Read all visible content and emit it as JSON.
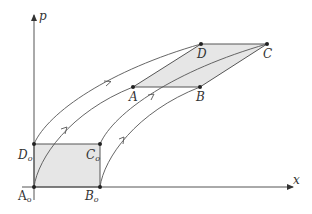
{
  "figure": {
    "axes": {
      "x_label": "x",
      "y_label": "p",
      "origin": [
        34,
        187
      ],
      "x_end": [
        293,
        187
      ],
      "y_end": [
        34,
        14
      ]
    },
    "colors": {
      "stroke": "#555555",
      "fill": "#e6e6e6",
      "point": "#222222",
      "text": "#333333"
    },
    "initial_region": {
      "vertices": {
        "A0": [
          34,
          187
        ],
        "B0": [
          100,
          187
        ],
        "C0": [
          100,
          144
        ],
        "D0": [
          34,
          144
        ]
      },
      "labels": {
        "A0": "A",
        "B0": "B",
        "C0": "C",
        "D0": "D",
        "subscript": "o"
      }
    },
    "evolved_region": {
      "vertices": {
        "A": [
          133,
          87
        ],
        "B": [
          200,
          87
        ],
        "C": [
          267,
          44
        ],
        "D": [
          201,
          44
        ]
      },
      "labels": {
        "A": "A",
        "B": "B",
        "C": "C",
        "D": "D"
      }
    },
    "trajectories": [
      {
        "from": "D0",
        "to": "D",
        "arrow_at": [
          110,
          82
        ]
      },
      {
        "from": "A0",
        "to": "A",
        "arrow_at": [
          66,
          130
        ]
      },
      {
        "from": "C0",
        "to": "C",
        "arrow_at": [
          153,
          96
        ]
      },
      {
        "from": "B0",
        "to": "B",
        "arrow_at": [
          123,
          140
        ]
      }
    ]
  }
}
